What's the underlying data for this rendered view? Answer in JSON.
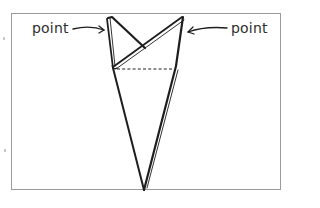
{
  "figure": {
    "type": "folding-diagram",
    "labels": [
      {
        "id": "left",
        "text": "point"
      },
      {
        "id": "right",
        "text": "point"
      }
    ],
    "colors": {
      "frame_border": "#9a9a9a",
      "ink": "#1e1e1e",
      "label_text": "#2e2e2e",
      "background": "#ffffff"
    },
    "fold_line": {
      "style": "dashed"
    }
  }
}
